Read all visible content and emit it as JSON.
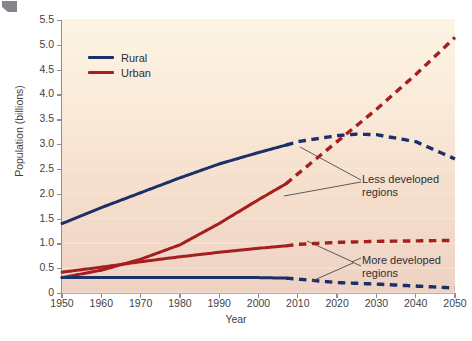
{
  "figure": {
    "corner_mark": "corner-artifact"
  },
  "chart_data": {
    "type": "line",
    "title": "",
    "xlabel": "Year",
    "ylabel": "Population (billions)",
    "xlim": [
      1950,
      2050
    ],
    "ylim": [
      0,
      5.5
    ],
    "xticks": [
      1950,
      1960,
      1970,
      1980,
      1990,
      2000,
      2010,
      2020,
      2030,
      2040,
      2050
    ],
    "yticks": [
      "0",
      "0.5",
      "1.0",
      "1.5",
      "2.0",
      "2.5",
      "3.0",
      "3.5",
      "4.0",
      "4.5",
      "5.0",
      "5.5"
    ],
    "grid": "horizontal",
    "legend": {
      "position": "top-left",
      "entries": [
        {
          "label": "Rural",
          "color": "#1b2f68"
        },
        {
          "label": "Urban",
          "color": "#a61f1f"
        }
      ]
    },
    "projection_start_year": 2007,
    "series": [
      {
        "name": "Rural – Less developed regions",
        "color": "#1b2f68",
        "region": "Less developed regions",
        "x": [
          1950,
          1960,
          1970,
          1980,
          1990,
          2000,
          2007,
          2010,
          2020,
          2025,
          2030,
          2040,
          2050
        ],
        "values": [
          1.4,
          1.72,
          2.02,
          2.32,
          2.6,
          2.83,
          2.98,
          3.05,
          3.17,
          3.2,
          3.19,
          3.05,
          2.7
        ],
        "observed_through": 2007
      },
      {
        "name": "Urban – Less developed regions",
        "color": "#a61f1f",
        "region": "Less developed regions",
        "x": [
          1950,
          1960,
          1970,
          1980,
          1990,
          2000,
          2007,
          2010,
          2020,
          2030,
          2040,
          2050
        ],
        "values": [
          0.31,
          0.46,
          0.68,
          0.97,
          1.4,
          1.88,
          2.2,
          2.4,
          3.05,
          3.7,
          4.4,
          5.15
        ],
        "observed_through": 2007
      },
      {
        "name": "Urban – More developed regions",
        "color": "#a61f1f",
        "region": "More developed regions",
        "x": [
          1950,
          1960,
          1970,
          1980,
          1990,
          2000,
          2007,
          2010,
          2020,
          2030,
          2040,
          2050
        ],
        "values": [
          0.42,
          0.52,
          0.63,
          0.73,
          0.82,
          0.9,
          0.95,
          0.98,
          1.02,
          1.04,
          1.05,
          1.06
        ],
        "observed_through": 2007
      },
      {
        "name": "Rural – More developed regions",
        "color": "#1b2f68",
        "region": "More developed regions",
        "x": [
          1950,
          1960,
          1970,
          1980,
          1990,
          2000,
          2007,
          2010,
          2020,
          2030,
          2040,
          2050
        ],
        "values": [
          0.31,
          0.31,
          0.31,
          0.31,
          0.31,
          0.31,
          0.3,
          0.28,
          0.21,
          0.18,
          0.14,
          0.1
        ],
        "observed_through": 2007
      }
    ],
    "annotations": [
      {
        "text": "Less developed\nregions",
        "points_to": [
          "Rural – Less developed regions",
          "Urban – Less developed regions"
        ]
      },
      {
        "text": "More developed\nregions",
        "points_to": [
          "Urban – More developed regions",
          "Rural – More developed regions"
        ]
      }
    ],
    "colors": {
      "rural": "#1b2f68",
      "urban": "#a61f1f",
      "plot_background_top": "#fdf4e3",
      "plot_background_bottom": "#eed2c4",
      "axis": "#8d8d93",
      "gridline": "#fbe9d8"
    }
  }
}
